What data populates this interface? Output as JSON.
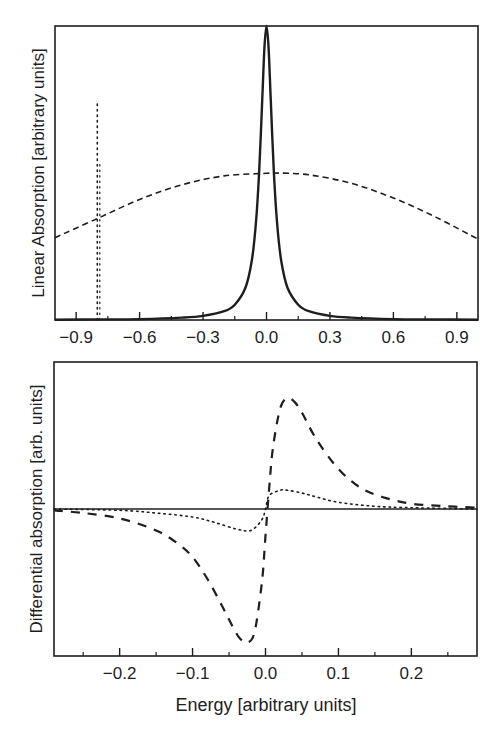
{
  "chart_data": [
    {
      "type": "line",
      "panel": "top",
      "title": "",
      "xlabel": "",
      "ylabel": "Linear Absorption [arbitrary units]",
      "xlim": [
        -1.0,
        1.0
      ],
      "ylim": [
        0,
        1.0
      ],
      "xticks": [
        -0.9,
        -0.6,
        -0.3,
        0.0,
        0.3,
        0.6,
        0.9
      ],
      "xtick_labels": [
        "−0.9",
        "−0.6",
        "−0.3",
        "0.0",
        "0.3",
        "0.6",
        "0.9"
      ],
      "minor_xticks": [
        -0.75,
        -0.45,
        -0.15,
        0.15,
        0.45,
        0.75
      ],
      "yticks": [],
      "grid": false,
      "legend": null,
      "series": [
        {
          "name": "Lorentzian absorption line",
          "style": "solid",
          "x": [
            -1.0,
            -0.8,
            -0.6,
            -0.4,
            -0.3,
            -0.2,
            -0.15,
            -0.1,
            -0.07,
            -0.05,
            -0.035,
            -0.02,
            -0.01,
            0.0,
            0.01,
            0.02,
            0.035,
            0.05,
            0.07,
            0.1,
            0.15,
            0.2,
            0.3,
            0.4,
            0.6,
            0.8,
            1.0
          ],
          "values": [
            0.001,
            0.002,
            0.003,
            0.008,
            0.014,
            0.03,
            0.052,
            0.109,
            0.2,
            0.33,
            0.5,
            0.754,
            0.925,
            1.0,
            0.925,
            0.754,
            0.5,
            0.33,
            0.2,
            0.109,
            0.052,
            0.03,
            0.014,
            0.008,
            0.003,
            0.002,
            0.001
          ]
        },
        {
          "name": "Inhomogeneous (Gaussian) distribution",
          "style": "dashed",
          "x": [
            -1.0,
            -0.8,
            -0.6,
            -0.4,
            -0.2,
            0.0,
            0.03,
            0.2,
            0.4,
            0.6,
            0.8,
            1.0
          ],
          "values": [
            0.28,
            0.345,
            0.41,
            0.46,
            0.49,
            0.499,
            0.5,
            0.494,
            0.465,
            0.415,
            0.35,
            0.275
          ]
        },
        {
          "name": "Narrow probe/pump line",
          "style": "dotted",
          "x": [
            -0.8,
            -0.8
          ],
          "values": [
            0.0,
            0.74
          ]
        }
      ]
    },
    {
      "type": "line",
      "panel": "bottom",
      "title": "",
      "xlabel": "Energy [arbitrary units]",
      "ylabel": "Differential absorption [arb. units]",
      "xlim": [
        -0.29,
        0.29
      ],
      "ylim": [
        -1.1,
        1.1
      ],
      "xticks": [
        -0.2,
        -0.1,
        0.0,
        0.1,
        0.2
      ],
      "xtick_labels": [
        "−0.2",
        "−0.1",
        "0.0",
        "0.1",
        "0.2"
      ],
      "minor_xticks": [
        -0.25,
        -0.15,
        -0.05,
        0.05,
        0.15,
        0.25
      ],
      "yticks": [],
      "zero_line": true,
      "grid": false,
      "legend": null,
      "series": [
        {
          "name": "Differential absorption (dashed)",
          "style": "dashed",
          "x": [
            -0.29,
            -0.25,
            -0.2,
            -0.15,
            -0.12,
            -0.1,
            -0.08,
            -0.06,
            -0.045,
            -0.035,
            -0.025,
            -0.015,
            -0.005,
            0.0,
            0.005,
            0.01,
            0.02,
            0.03,
            0.04,
            0.05,
            0.07,
            0.1,
            0.13,
            0.16,
            0.2,
            0.25,
            0.29
          ],
          "values": [
            -0.01,
            -0.03,
            -0.07,
            -0.16,
            -0.26,
            -0.36,
            -0.52,
            -0.72,
            -0.88,
            -0.97,
            -1.0,
            -0.92,
            -0.55,
            -0.2,
            0.15,
            0.45,
            0.75,
            0.83,
            0.8,
            0.72,
            0.52,
            0.3,
            0.16,
            0.09,
            0.04,
            0.02,
            0.01
          ]
        },
        {
          "name": "Differential absorption (dotted)",
          "style": "dotted",
          "x": [
            -0.29,
            -0.2,
            -0.15,
            -0.1,
            -0.07,
            -0.04,
            -0.02,
            -0.005,
            0.0,
            0.005,
            0.02,
            0.03,
            0.05,
            0.07,
            0.1,
            0.15,
            0.2,
            0.29
          ],
          "values": [
            0.0,
            -0.01,
            -0.03,
            -0.06,
            -0.1,
            -0.15,
            -0.16,
            -0.08,
            0.0,
            0.1,
            0.14,
            0.14,
            0.12,
            0.09,
            0.05,
            0.02,
            0.01,
            0.0
          ]
        },
        {
          "name": "Zero baseline",
          "style": "solid",
          "x": [
            -0.29,
            0.29
          ],
          "values": [
            0.0,
            0.0
          ]
        }
      ]
    }
  ],
  "labels": {
    "top_ylabel": "Linear Absorption [arbitrary units]",
    "bottom_ylabel": "Differential absorption [arb. units]",
    "bottom_xlabel": "Energy [arbitrary units]"
  },
  "colors": {
    "ink": "#1e1e1e",
    "background": "#ffffff"
  }
}
